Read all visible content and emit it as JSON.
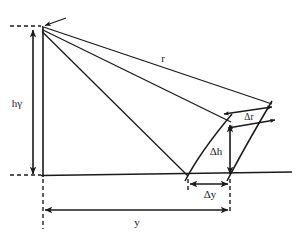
{
  "figure": {
    "type": "line-diagram",
    "background_color": "#ffffff",
    "stroke_color": "#1a1a1a",
    "width": 299,
    "height": 238,
    "labels": [
      {
        "id": "h-gamma",
        "name": "height-label",
        "text": "hγ",
        "meaning": "observer height h gamma",
        "x": 17,
        "y": 104
      },
      {
        "id": "r",
        "name": "slant-range-label",
        "text": "r",
        "meaning": "slant range",
        "x": 163,
        "y": 59
      },
      {
        "id": "delta-r",
        "name": "delta-r-label",
        "text": "Δr",
        "meaning": "increment of slant range",
        "x": 249,
        "y": 118
      },
      {
        "id": "delta-h",
        "name": "delta-h-label",
        "text": "Δh",
        "meaning": "increment of height",
        "x": 216,
        "y": 152
      },
      {
        "id": "delta-y",
        "name": "delta-y-label",
        "text": "Δy",
        "meaning": "increment of horizontal distance",
        "x": 210,
        "y": 194
      },
      {
        "id": "y",
        "name": "horizontal-distance-label",
        "text": "y",
        "meaning": "horizontal distance",
        "x": 137,
        "y": 222
      }
    ],
    "points": {
      "apex": {
        "name": "apex-vertex",
        "x": 41,
        "y": 26
      },
      "base_left": {
        "name": "base-left-vertex",
        "x": 43,
        "y": 175
      },
      "base_mid": {
        "name": "base-mid-vertex",
        "x": 188,
        "y": 176
      },
      "base_right": {
        "name": "base-right-vertex",
        "x": 230,
        "y": 176
      },
      "arc_inner_top": {
        "name": "inner-arc-upper-point",
        "x": 231,
        "y": 122
      },
      "arc_outer_top": {
        "name": "outer-arc-upper-point",
        "x": 268,
        "y": 109
      }
    },
    "dimension_arrows": [
      {
        "name": "h-gamma-dimension",
        "orientation": "vertical",
        "x": 33,
        "from": 28,
        "to": 177
      },
      {
        "name": "delta-h-dimension",
        "orientation": "vertical",
        "x": 230,
        "from": 122,
        "to": 176
      },
      {
        "name": "delta-y-dimension",
        "orientation": "horizontal",
        "y": 184,
        "from": 188,
        "to": 230
      },
      {
        "name": "y-dimension",
        "orientation": "horizontal",
        "y": 210,
        "from": 43,
        "to": 230
      },
      {
        "name": "delta-r-upper-dimension",
        "orientation": "slanted",
        "from_x": 222,
        "from_y": 113,
        "to_x": 274,
        "to_y": 106
      },
      {
        "name": "delta-r-lower-dimension",
        "orientation": "slanted",
        "from_x": 226,
        "from_y": 127,
        "to_x": 276,
        "to_y": 119
      }
    ],
    "guide_lines": [
      {
        "name": "top-dashed-guide",
        "style": "dashed",
        "from_x": 10,
        "from_y": 26,
        "to_x": 41,
        "to_y": 26
      },
      {
        "name": "baseline-dashed-guide",
        "style": "dashed",
        "from_x": 10,
        "from_y": 175,
        "to_x": 41,
        "to_y": 175
      },
      {
        "name": "left-vertical-dashed",
        "style": "dashed",
        "from_x": 43,
        "from_y": 178,
        "to_x": 43,
        "to_y": 228
      },
      {
        "name": "right-vertical-dashed",
        "style": "dashed",
        "from_x": 230,
        "from_y": 178,
        "to_x": 230,
        "to_y": 214
      },
      {
        "name": "mid-vertical-tick",
        "style": "dashed",
        "from_x": 188,
        "from_y": 178,
        "to_x": 188,
        "to_y": 190
      }
    ],
    "rays": [
      {
        "name": "ray-upper-to-outer-arc",
        "from": "apex",
        "to_x": 272,
        "to_y": 104
      },
      {
        "name": "ray-mid-to-inner-arc",
        "from": "apex",
        "to_x": 231,
        "to_y": 122
      },
      {
        "name": "ray-lower-to-base-mid",
        "from": "apex",
        "to_x": 188,
        "to_y": 176
      }
    ],
    "arcs": [
      {
        "name": "inner-arc",
        "description": "inner curved surface through base-mid and inner-arc-upper-point"
      },
      {
        "name": "outer-arc",
        "description": "outer curved surface through base-right and outer-arc-upper-point"
      }
    ],
    "baseline": {
      "name": "horizontal-baseline",
      "from_x": 41,
      "from_y": 175,
      "to_x": 292,
      "to_y": 172
    },
    "vertical_side": {
      "name": "left-vertical-side",
      "from_x": 43,
      "from_y": 26,
      "to_x": 43,
      "to_y": 177
    }
  }
}
